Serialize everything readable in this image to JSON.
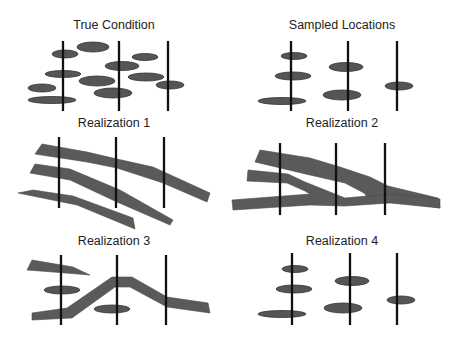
{
  "figure": {
    "colors": {
      "background": "#ffffff",
      "fill": "#5a5a5a",
      "well": "#111111",
      "text": "#222222"
    },
    "panels": [
      {
        "id": "true-condition",
        "title": "True Condition",
        "title_pos": [
          114,
          29
        ],
        "wells": [
          {
            "x": 63,
            "y1": 41,
            "y2": 111
          },
          {
            "x": 119,
            "y1": 41,
            "y2": 111
          },
          {
            "x": 168,
            "y1": 41,
            "y2": 111
          }
        ],
        "lenses": [
          {
            "cx": 93,
            "cy": 47,
            "rx": 16,
            "ry": 5
          },
          {
            "cx": 65,
            "cy": 54,
            "rx": 13,
            "ry": 4
          },
          {
            "cx": 145,
            "cy": 57,
            "rx": 13,
            "ry": 3.5
          },
          {
            "cx": 122,
            "cy": 66,
            "rx": 17,
            "ry": 4.5
          },
          {
            "cx": 63,
            "cy": 74,
            "rx": 18,
            "ry": 3.5
          },
          {
            "cx": 146,
            "cy": 77,
            "rx": 18,
            "ry": 4
          },
          {
            "cx": 97,
            "cy": 81,
            "rx": 18,
            "ry": 5
          },
          {
            "cx": 42,
            "cy": 88,
            "rx": 14,
            "ry": 4
          },
          {
            "cx": 170,
            "cy": 85,
            "rx": 14,
            "ry": 4
          },
          {
            "cx": 113,
            "cy": 93,
            "rx": 19,
            "ry": 5
          },
          {
            "cx": 52,
            "cy": 100,
            "rx": 24,
            "ry": 3.5
          }
        ],
        "bands": []
      },
      {
        "id": "sampled-locations",
        "title": "Sampled Locations",
        "title_pos": [
          342,
          29
        ],
        "wells": [
          {
            "x": 291,
            "y1": 41,
            "y2": 111
          },
          {
            "x": 348,
            "y1": 41,
            "y2": 111
          },
          {
            "x": 397,
            "y1": 41,
            "y2": 111
          }
        ],
        "lenses": [
          {
            "cx": 294,
            "cy": 56,
            "rx": 13,
            "ry": 3.5
          },
          {
            "cx": 293,
            "cy": 76,
            "rx": 18,
            "ry": 4
          },
          {
            "cx": 346,
            "cy": 67,
            "rx": 17,
            "ry": 4.5
          },
          {
            "cx": 399,
            "cy": 86,
            "rx": 14,
            "ry": 4
          },
          {
            "cx": 342,
            "cy": 95,
            "rx": 19,
            "ry": 5
          },
          {
            "cx": 282,
            "cy": 101,
            "rx": 24,
            "ry": 3.5
          }
        ],
        "bands": []
      },
      {
        "id": "realization-1",
        "title": "Realization 1",
        "title_pos": [
          114,
          127
        ],
        "wells": [
          {
            "x": 59,
            "y1": 137,
            "y2": 208
          },
          {
            "x": 116,
            "y1": 137,
            "y2": 208
          },
          {
            "x": 164,
            "y1": 137,
            "y2": 208
          }
        ],
        "lenses": [],
        "bands": [
          "42,144 87,152 117,159 153,167 210,193 207,202 163,183 117,168 87,162 35,154",
          "35,164 70,169 120,190 173,220 170,225 117,202 70,180 30,173",
          "33,190 73,196 133,218 135,229 77,205 18,193"
        ]
      },
      {
        "id": "realization-2",
        "title": "Realization 2",
        "title_pos": [
          342,
          127
        ],
        "wells": [
          {
            "x": 280,
            "y1": 143,
            "y2": 215
          },
          {
            "x": 336,
            "y1": 143,
            "y2": 215
          },
          {
            "x": 385,
            "y1": 143,
            "y2": 215
          }
        ],
        "lenses": [],
        "bands": [
          "260,150 310,158 340,167 370,177 388,186 438,198 440,208 388,200 368,198 364,193 345,183 310,175 255,162",
          "248,170 288,174 305,182 345,198 390,194 440,199 440,208 390,203 345,206 310,205 233,210 232,200 310,194 305,191 287,183 247,181"
        ]
      },
      {
        "id": "realization-3",
        "title": "Realization 3",
        "title_pos": [
          114,
          245
        ],
        "wells": [
          {
            "x": 61,
            "y1": 255,
            "y2": 325
          },
          {
            "x": 117,
            "y1": 255,
            "y2": 325
          },
          {
            "x": 166,
            "y1": 255,
            "y2": 325
          }
        ],
        "lenses": [
          {
            "cx": 62,
            "cy": 290,
            "rx": 18,
            "ry": 4
          },
          {
            "cx": 112,
            "cy": 309,
            "rx": 18,
            "ry": 4
          }
        ],
        "bands": [
          "32,260 73,267 90,275 53,272 27,270",
          "32,313 67,308 112,277 132,277 167,297 208,303 210,313 167,307 130,287 115,287 72,318 32,320"
        ]
      },
      {
        "id": "realization-4",
        "title": "Realization 4",
        "title_pos": [
          342,
          245
        ],
        "wells": [
          {
            "x": 292,
            "y1": 253,
            "y2": 325
          },
          {
            "x": 350,
            "y1": 253,
            "y2": 325
          },
          {
            "x": 397,
            "y1": 253,
            "y2": 325
          }
        ],
        "lenses": [
          {
            "cx": 295,
            "cy": 269,
            "rx": 13,
            "ry": 3.5
          },
          {
            "cx": 294,
            "cy": 289,
            "rx": 18,
            "ry": 4
          },
          {
            "cx": 352,
            "cy": 281,
            "rx": 17,
            "ry": 4.5
          },
          {
            "cx": 401,
            "cy": 300,
            "rx": 14,
            "ry": 4
          },
          {
            "cx": 343,
            "cy": 308,
            "rx": 19,
            "ry": 5
          },
          {
            "cx": 282,
            "cy": 314,
            "rx": 24,
            "ry": 3.5
          }
        ],
        "bands": []
      }
    ]
  }
}
